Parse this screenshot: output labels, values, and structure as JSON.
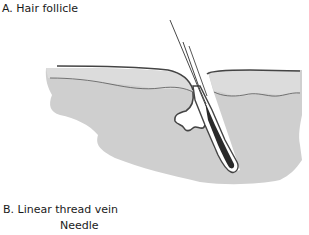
{
  "figure": {
    "section_a_title": "A. Hair follicle",
    "section_b_title": "B. Linear thread vein",
    "section_b_sublabel": "Needle"
  },
  "colors": {
    "skin_fill": "#cfcfcf",
    "epidermis_fill": "#d9d9d9",
    "outline": "#444444",
    "hair_bulb": "#2a2a2a",
    "background": "#ffffff"
  }
}
